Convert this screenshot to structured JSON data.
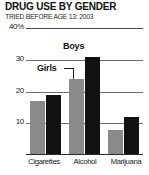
{
  "header": {
    "title": "DRUG USE BY GENDER",
    "subtitle": "TRIED BEFORE AGE 13: 2003"
  },
  "chart_data": {
    "type": "bar",
    "title": "DRUG USE BY GENDER",
    "subtitle": "TRIED BEFORE AGE 13: 2003",
    "xlabel": "",
    "ylabel": "",
    "ylim": [
      0,
      40
    ],
    "grid": true,
    "legend_position": "inline-annotations",
    "categories": [
      "Cigarettes",
      "Alcohol",
      "Marijuana"
    ],
    "series": [
      {
        "name": "Girls",
        "color": "#8a8a8a",
        "values": [
          17,
          24,
          8
        ]
      },
      {
        "name": "Boys",
        "color": "#111111",
        "values": [
          19,
          31,
          12
        ]
      }
    ],
    "ticks": [
      {
        "label": "40%",
        "value": 40
      },
      {
        "label": "30",
        "value": 30
      },
      {
        "label": "20",
        "value": 20
      },
      {
        "label": "10",
        "value": 10
      }
    ],
    "annotations": [
      {
        "text": "Boys",
        "series": "Boys",
        "category": "Alcohol"
      },
      {
        "text": "Girls",
        "series": "Girls",
        "category": "Alcohol"
      }
    ]
  },
  "colors": {
    "girls_bar": "#8a8a8a",
    "boys_bar": "#111111",
    "gridline": "#6f6f6f",
    "text": "#1a1a1a"
  }
}
